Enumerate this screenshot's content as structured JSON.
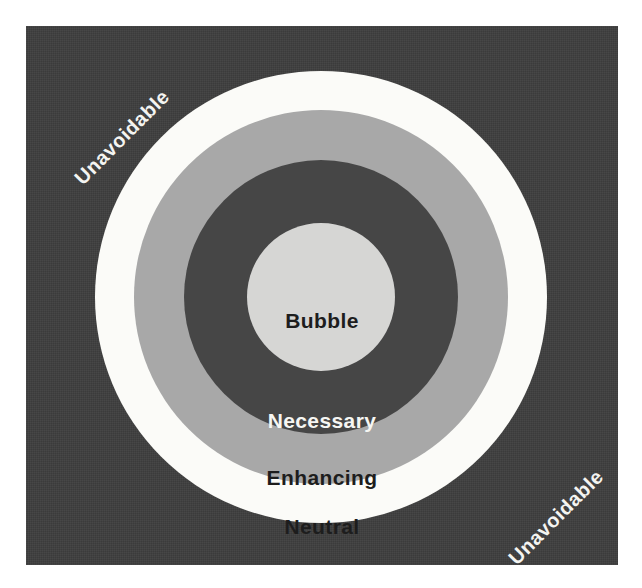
{
  "diagram": {
    "type": "concentric-rings",
    "title_visible": false,
    "background_color": "#3e3e3e",
    "page_color": "#ffffff",
    "rings": [
      {
        "id": "bubble",
        "label": "Bubble",
        "fill": "#d6d6d4",
        "text_color": "#1d1d1d",
        "level": 1,
        "shape": "circle"
      },
      {
        "id": "necessary",
        "label": "Necessary",
        "fill": "#464646",
        "text_color": "#f6f6f3",
        "level": 2,
        "shape": "ring"
      },
      {
        "id": "enhancing",
        "label": "Enhancing",
        "fill": "#a8a8a8",
        "text_color": "#1d1d1d",
        "level": 3,
        "shape": "ring"
      },
      {
        "id": "neutral",
        "label": "Neutral",
        "fill": "#fbfbf8",
        "text_color": "#1d1d1d",
        "level": 4,
        "shape": "ring"
      }
    ],
    "outside_labels": [
      {
        "id": "unavoidable-top-left",
        "label": "Unavoidable",
        "text_color": "#f4f4f1",
        "rotation_deg": -45,
        "corner": "top-left"
      },
      {
        "id": "unavoidable-bottom-right",
        "label": "Unavoidable",
        "text_color": "#f4f4f1",
        "rotation_deg": -45,
        "corner": "bottom-right"
      }
    ]
  }
}
